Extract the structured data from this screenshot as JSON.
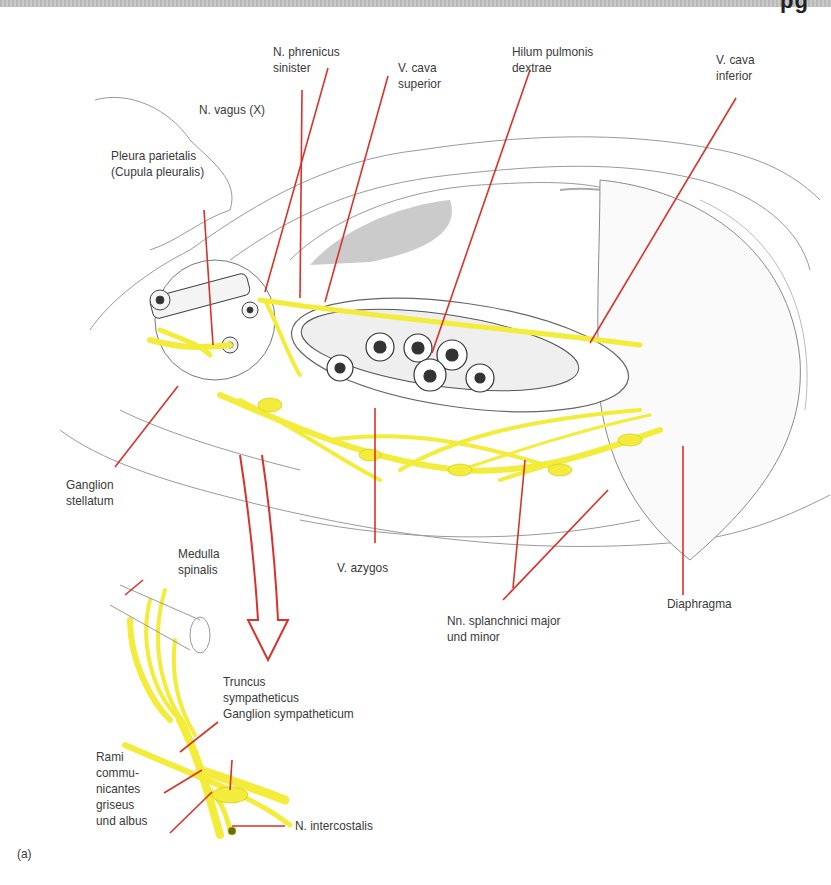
{
  "header": {
    "title_fragment": "pg"
  },
  "figure_label": "(a)",
  "colors": {
    "nerve_yellow": "#f3ec3a",
    "nerve_outline": "#c9c21a",
    "leader_red": "#d9322b",
    "sketch_gray": "#8a8a8a",
    "text": "#3a3a3a"
  },
  "labels": {
    "n_phrenicus": "N. phrenicus\nsinister",
    "v_cava_superior": "V. cava\nsuperior",
    "hilum": "Hilum pulmonis\ndextrae",
    "v_cava_inferior": "V. cava\ninferior",
    "n_vagus": "N. vagus (X)",
    "pleura": "Pleura parietalis\n(Cupula pleuralis)",
    "ganglion_stellatum": "Ganglion\nstellatum",
    "medulla": "Medulla\nspinalis",
    "v_azygos": "V. azygos",
    "diaphragma": "Diaphragma",
    "nn_splanchnici": "Nn. splanchnici major\nund minor",
    "truncus": "Truncus\nsympatheticus\nGanglion sympatheticum",
    "rami": "Rami\ncommu-\nnicantes\ngriseus\nund albus",
    "n_intercostalis": "N. intercostalis"
  }
}
